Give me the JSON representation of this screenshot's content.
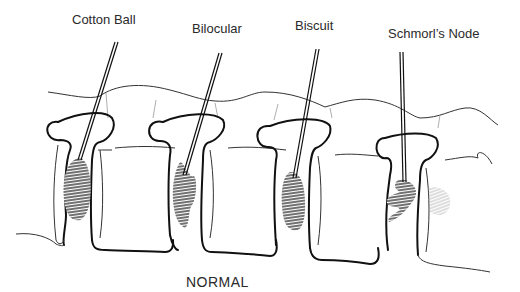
{
  "diagram": {
    "labels": [
      {
        "id": "cotton-ball",
        "text": "Cotton Ball"
      },
      {
        "id": "bilocular",
        "text": "Bilocular"
      },
      {
        "id": "biscuit",
        "text": "Biscuit"
      },
      {
        "id": "schmorls-node",
        "text": "Schmorl’s Node"
      }
    ],
    "caption": "NORMAL"
  }
}
